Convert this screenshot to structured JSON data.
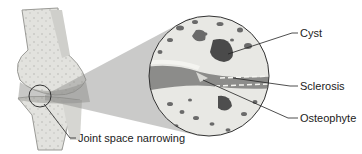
{
  "diagram": {
    "labels": {
      "cyst": "Cyst",
      "sclerosis": "Sclerosis",
      "osteophyte": "Osteophyte",
      "joint_space": "Joint space narrowing"
    },
    "colors": {
      "bone": "#e6e6e2",
      "cartilage_dark": "#8a8a8a",
      "cavity": "#5a5a5a",
      "outline": "#333333"
    }
  }
}
